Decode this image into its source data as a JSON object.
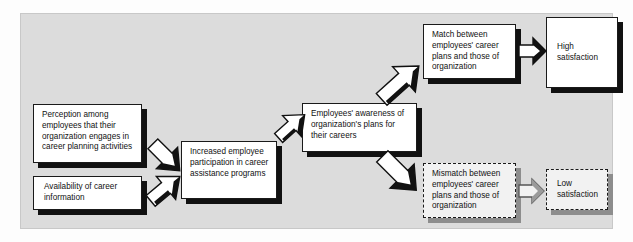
{
  "diagram": {
    "panel_color": "#dcdcdc",
    "box_fill": "#ffffff",
    "shadow_color": "#111111",
    "gray_shadow_color": "#8d8d8d",
    "nodes": [
      {
        "id": "perception",
        "name": "perception-box",
        "text": "Perception among employees that their organization engages in career planning activities",
        "style": "solid"
      },
      {
        "id": "availability",
        "name": "availability-box",
        "text": "Availability of career information",
        "style": "solid"
      },
      {
        "id": "participation",
        "name": "participation-box",
        "text": "Increased employee participation in career assistance programs",
        "style": "solid"
      },
      {
        "id": "awareness",
        "name": "awareness-box",
        "text": "Employees' awareness of organization's plans for their careers",
        "style": "solid"
      },
      {
        "id": "match",
        "name": "match-box",
        "text": "Match between employees' career plans and those of organization",
        "style": "solid"
      },
      {
        "id": "mismatch",
        "name": "mismatch-box",
        "text": "Mismatch between employees' career plans and those of organization",
        "style": "dashed"
      },
      {
        "id": "high_satisfaction",
        "name": "high-satisfaction-box",
        "text": "High satisfaction",
        "style": "solid"
      },
      {
        "id": "low_satisfaction",
        "name": "low-satisfaction-box",
        "text": "Low satisfaction",
        "style": "dashed"
      }
    ],
    "arrows": [
      {
        "id": "a1",
        "name": "arrow-perception-to-participation",
        "direction": "down-right"
      },
      {
        "id": "a2",
        "name": "arrow-availability-to-participation",
        "direction": "up-right"
      },
      {
        "id": "a3",
        "name": "arrow-participation-to-awareness",
        "direction": "up-right"
      },
      {
        "id": "a4",
        "name": "arrow-awareness-to-match",
        "direction": "up-right"
      },
      {
        "id": "a5",
        "name": "arrow-awareness-to-mismatch",
        "direction": "down-right"
      },
      {
        "id": "a6",
        "name": "arrow-match-to-high-satisfaction",
        "direction": "right"
      },
      {
        "id": "a7",
        "name": "arrow-mismatch-to-low-satisfaction",
        "direction": "right"
      }
    ]
  }
}
